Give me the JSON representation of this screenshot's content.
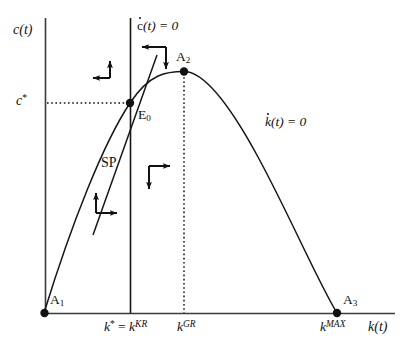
{
  "figure": {
    "type": "phase-diagram",
    "title": "",
    "axes": {
      "y_label": "c(t)",
      "x_label": "k(t)",
      "x_axis_start": 44,
      "x_axis_end": 395,
      "y_axis_top": 18,
      "y_axis_bottom": 313,
      "origin": [
        44,
        313
      ]
    },
    "labels": {
      "y_axis": "c(t)",
      "x_axis": "k(t)",
      "c_star": "c",
      "c_star_sup": "*",
      "cdot_locus_prefix": "c",
      "cdot_locus_suffix": "(t) = 0",
      "kdot_locus_prefix": "k",
      "kdot_locus_suffix": "(t) = 0",
      "saddle_path": "SP",
      "point_a1": "A",
      "point_a1_sub": "1",
      "point_a2": "A",
      "point_a2_sub": "2",
      "point_a3": "A",
      "point_a3_sub": "3",
      "equilibrium": "E",
      "equilibrium_sub": "0",
      "k_star_kr": "k",
      "k_star_kr_sup": "*",
      "k_star_kr_eq": " = ",
      "k_star_kr_2": "k",
      "k_star_kr_2_sup": "KR",
      "k_gr": "k",
      "k_gr_sup": "GR",
      "k_max": "k",
      "k_max_sup": "MAX"
    },
    "colors": {
      "ink": "#111111",
      "axis": "#3a3a3a",
      "background": "#ffffff"
    },
    "points": [
      {
        "name": "A1",
        "x": 44,
        "y": 313,
        "label": "A₁"
      },
      {
        "name": "E0",
        "x": 130,
        "y": 103,
        "label": "E₀"
      },
      {
        "name": "A2",
        "x": 184,
        "y": 72,
        "label": "A₂"
      },
      {
        "name": "A3",
        "x": 337,
        "y": 313,
        "label": "A₃"
      }
    ],
    "curves": {
      "kdot_zero_path": "M 44 313 C 75 215, 103 143, 130 103 C 152 73, 168 72, 184 72 C 212 72, 248 133, 275 188 C 300 238, 322 288, 337 313",
      "saddle_path_line": {
        "x1": 96,
        "y1": 229,
        "x2": 156,
        "y2": 57
      },
      "cdot_zero_line": {
        "x": 130,
        "y1": 18,
        "y2": 313
      },
      "kgr_dotted_line": {
        "x": 184,
        "y1": 72,
        "y2": 313
      },
      "cstar_dotted_line": {
        "y": 103,
        "x1": 47,
        "x2": 130
      }
    },
    "arrow_pairs": [
      {
        "name": "upper-left",
        "corner": [
          110,
          78
        ],
        "arms": [
          "up",
          "left"
        ]
      },
      {
        "name": "upper-right",
        "corner": [
          166,
          48
        ],
        "arms": [
          "left",
          "down"
        ]
      },
      {
        "name": "lower-right",
        "corner": [
          149,
          165
        ],
        "arms": [
          "right",
          "down"
        ]
      },
      {
        "name": "lower-left",
        "corner": [
          96,
          212
        ],
        "arms": [
          "up",
          "right"
        ]
      }
    ]
  }
}
